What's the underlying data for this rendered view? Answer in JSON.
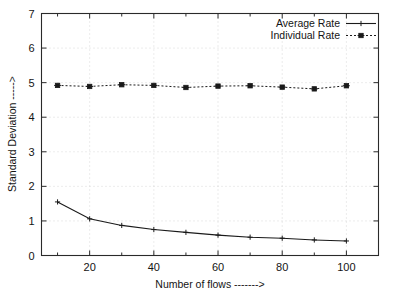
{
  "chart_data": {
    "type": "line",
    "title": "",
    "xlabel": "Number of flows ------->",
    "ylabel": "Standard Deviation ----->",
    "xlim": [
      5,
      110
    ],
    "ylim": [
      0,
      7
    ],
    "grid": true,
    "legend_position": "top-right",
    "x_ticks": [
      20,
      40,
      60,
      80,
      100
    ],
    "x_tick_labels": [
      "20",
      "40",
      "60",
      "80",
      "100"
    ],
    "x_minor_ticks": [
      10,
      30,
      50,
      70,
      90,
      110
    ],
    "y_ticks": [
      0,
      1,
      2,
      3,
      4,
      5,
      6,
      7
    ],
    "y_tick_labels": [
      "0",
      "1",
      "2",
      "3",
      "4",
      "5",
      "6",
      "7"
    ],
    "x": [
      10,
      20,
      30,
      40,
      50,
      60,
      70,
      80,
      90,
      100
    ],
    "series": [
      {
        "name": "Average Rate",
        "marker": "plus",
        "linestyle": "solid",
        "color": "#1a1a1a",
        "values": [
          1.55,
          1.06,
          0.87,
          0.75,
          0.67,
          0.59,
          0.53,
          0.5,
          0.45,
          0.42
        ]
      },
      {
        "name": "Individual Rate",
        "marker": "star",
        "linestyle": "dotted",
        "color": "#1a1a1a",
        "values": [
          4.92,
          4.89,
          4.94,
          4.92,
          4.86,
          4.9,
          4.91,
          4.87,
          4.82,
          4.91
        ]
      }
    ]
  },
  "legend": {
    "entries": [
      {
        "label": "Average Rate"
      },
      {
        "label": "Individual Rate"
      }
    ]
  },
  "axes": {
    "x_title": "Number of flows ------->",
    "y_title": "Standard Deviation ----->"
  }
}
